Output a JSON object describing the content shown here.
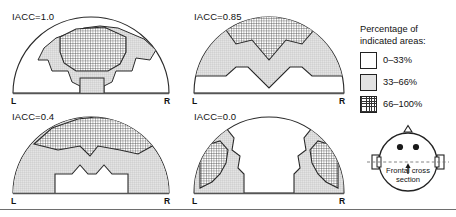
{
  "figure": {
    "type": "diagram-grid",
    "panel_count": 4,
    "description_axis": {
      "left": "L",
      "right": "R"
    }
  },
  "panels": [
    {
      "id": "iacc-1-0",
      "label": "IACC=1.0",
      "left_label": "L",
      "right_label": "R"
    },
    {
      "id": "iacc-0-85",
      "label": "IACC=0.85",
      "left_label": "L",
      "right_label": "R"
    },
    {
      "id": "iacc-0-4",
      "label": "IACC=0.4",
      "left_label": "L",
      "right_label": "R"
    },
    {
      "id": "iacc-0-0",
      "label": "IACC=0.0",
      "left_label": "L",
      "right_label": "R"
    }
  ],
  "legend": {
    "title_line1": "Percentage of",
    "title_line2": "indicated areas:",
    "items": [
      {
        "swatch": "none",
        "label": "0–33%"
      },
      {
        "swatch": "mid",
        "label": "33–66%"
      },
      {
        "swatch": "high",
        "label": "66–100%"
      }
    ]
  },
  "head_diagram": {
    "caption_line1": "Frontal cross",
    "caption_line2": "section",
    "icon": "head-top-view-icon"
  },
  "colors": {
    "ink": "#1a1a1a",
    "outline": "#222222",
    "mid_fill": "#e2e2e2",
    "hatch": "#333333",
    "rule": "#6e6e6e",
    "background": "#ffffff"
  }
}
